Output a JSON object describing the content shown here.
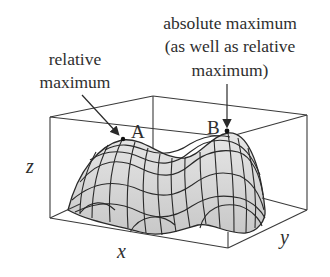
{
  "figure": {
    "type": "3d-surface-diagram",
    "annotations": {
      "relative_max": {
        "lines": [
          "relative",
          "maximum"
        ],
        "point_label": "A"
      },
      "absolute_max": {
        "lines": [
          "absolute maximum",
          "(as well as relative",
          "maximum)"
        ],
        "point_label": "B"
      }
    },
    "axes": {
      "x": "x",
      "y": "y",
      "z": "z"
    },
    "colors": {
      "surface_fill": "#d9d9d9",
      "grid_lines": "#2a2a2a",
      "box_lines": "#3a3a3a",
      "text": "#2e2e2e"
    }
  }
}
